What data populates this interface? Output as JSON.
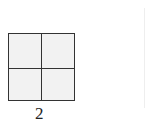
{
  "figure": {
    "grid": {
      "rows": 2,
      "cols": 2,
      "fill": "#f2f2f2",
      "stroke": "#333333"
    },
    "label": "2"
  }
}
